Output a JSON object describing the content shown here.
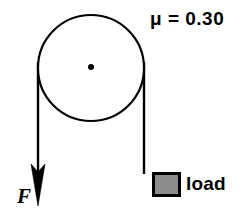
{
  "figure": {
    "type": "physics-free-body-diagram",
    "background_color": "#ffffff",
    "stroke_color": "#000000"
  },
  "pulley": {
    "name": "pulley-wheel",
    "center_x": 91,
    "center_y": 68,
    "radius": 53,
    "stroke_width": 2.2,
    "fill": "#ffffff",
    "axle_dot_radius": 3
  },
  "ropes": {
    "left": {
      "name": "left-rope",
      "x": 38,
      "y_top": 68,
      "y_bottom": 170,
      "stroke_width": 2.4
    },
    "right": {
      "name": "right-rope",
      "x": 144,
      "y_top": 68,
      "y_bottom": 173,
      "stroke_width": 2.4
    }
  },
  "arrow": {
    "name": "force-arrow",
    "direction": "down",
    "tip_x": 38,
    "tip_y": 206,
    "head_top_y": 164,
    "head_half_width": 7
  },
  "block": {
    "name": "load-block",
    "x": 152,
    "y": 172,
    "width": 29,
    "height": 25,
    "fill_color": "#8c8c8c",
    "border_color": "#000000",
    "border_width": 3
  },
  "labels": {
    "friction": "μ = 0.30",
    "load": "load",
    "force": "F"
  }
}
